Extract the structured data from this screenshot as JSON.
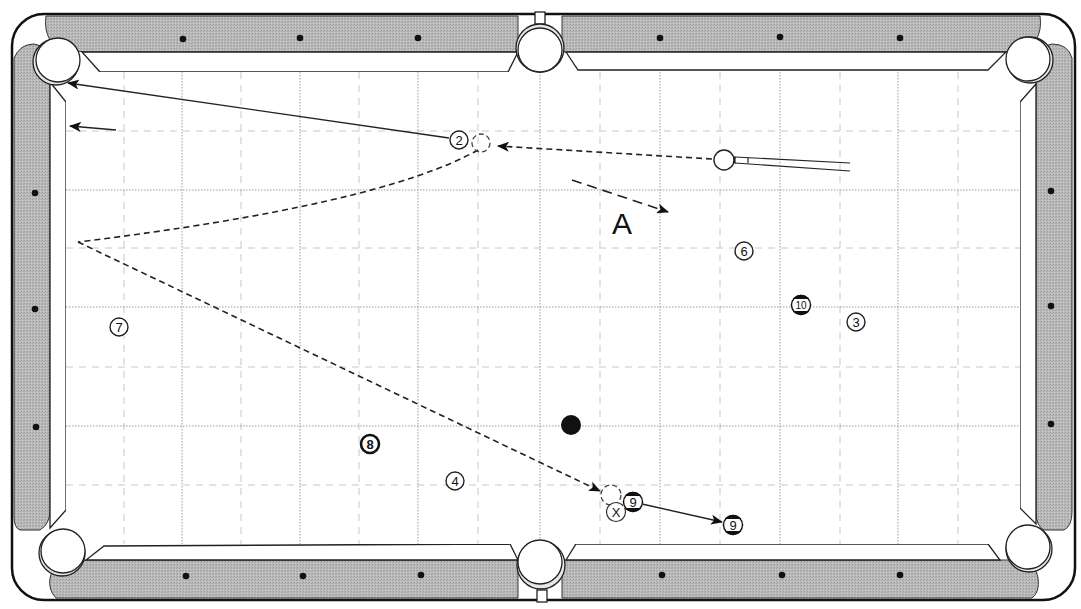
{
  "diagram": {
    "type": "pool-table-shot-diagram",
    "table": {
      "rail_color": "#b4b4b4",
      "cloth_color": "#ffffff",
      "outline_color": "#1a1a1a",
      "pockets": [
        "top-left",
        "top-middle",
        "top-right",
        "bottom-left",
        "bottom-middle",
        "bottom-right"
      ],
      "diamonds": {
        "top": 6,
        "bottom": 6,
        "left": 3,
        "right": 3
      }
    },
    "shot_label": "A",
    "balls": [
      {
        "id": "cue",
        "label": "",
        "type": "cue-ball"
      },
      {
        "id": "ball-2",
        "label": "2",
        "type": "solid"
      },
      {
        "id": "ball-3",
        "label": "3",
        "type": "solid"
      },
      {
        "id": "ball-4",
        "label": "4",
        "type": "solid"
      },
      {
        "id": "ball-6",
        "label": "6",
        "type": "solid"
      },
      {
        "id": "ball-7",
        "label": "7",
        "type": "solid"
      },
      {
        "id": "ball-8",
        "label": "8",
        "type": "eight-ball"
      },
      {
        "id": "ball-9",
        "label": "9",
        "type": "stripe"
      },
      {
        "id": "ball-9-final",
        "label": "9",
        "type": "stripe-final-position"
      },
      {
        "id": "ball-10",
        "label": "10",
        "type": "stripe"
      },
      {
        "id": "black-ball",
        "label": "",
        "type": "solid-black-marker"
      }
    ],
    "markers": {
      "x_label": "X"
    },
    "paths": [
      {
        "from": "cue",
        "to": "ghost-ball-2",
        "style": "dashed",
        "meaning": "cue ball path"
      },
      {
        "from": "ball-2",
        "to": "top-left-pocket",
        "style": "solid",
        "meaning": "object ball path"
      },
      {
        "from": "ghost-ball-2",
        "to": "left-rail",
        "style": "dashed",
        "meaning": "cue ball after contact"
      },
      {
        "from": "left-rail",
        "to": "ghost-ball-9",
        "style": "dashed",
        "meaning": "cue ball rebound"
      },
      {
        "from": "ball-9",
        "to": "ball-9-final",
        "style": "solid",
        "meaning": "9 ball travel"
      },
      {
        "from": "A-start",
        "to": "A-end",
        "style": "dashed",
        "meaning": "alternative direction A"
      },
      {
        "from": "left-arrow-start",
        "to": "left-arrow-end",
        "style": "solid",
        "meaning": "direction hint"
      }
    ]
  }
}
